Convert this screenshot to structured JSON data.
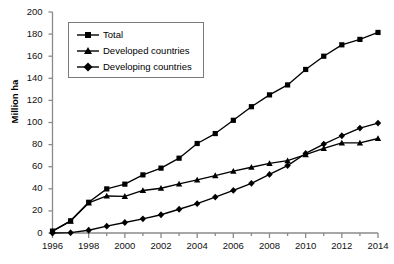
{
  "chart_data": {
    "type": "line",
    "title": "",
    "xlabel": "",
    "ylabel": "Million ha",
    "xlim": [
      1996,
      2014
    ],
    "ylim": [
      0,
      200
    ],
    "grid": false,
    "legend_position": "top-left",
    "x": [
      1996,
      1997,
      1998,
      1999,
      2000,
      2001,
      2002,
      2003,
      2004,
      2005,
      2006,
      2007,
      2008,
      2009,
      2010,
      2011,
      2012,
      2013,
      2014
    ],
    "xticks": [
      "1996",
      "1998",
      "2000",
      "2002",
      "2004",
      "2006",
      "2008",
      "2010",
      "2012",
      "2014"
    ],
    "yticks": [
      "0",
      "20",
      "40",
      "60",
      "80",
      "100",
      "120",
      "140",
      "160",
      "180",
      "200"
    ],
    "series": [
      {
        "name": "Total",
        "marker": "square",
        "values": [
          1.7,
          11.0,
          27.8,
          39.9,
          44.2,
          52.6,
          58.7,
          67.7,
          81.0,
          90.0,
          102.0,
          114.3,
          125.0,
          134.0,
          148.0,
          160.0,
          170.3,
          175.2,
          181.5
        ]
      },
      {
        "name": "Developed countries",
        "marker": "triangle",
        "values": [
          1.7,
          10.8,
          27.2,
          33.5,
          33.2,
          38.5,
          40.5,
          44.5,
          48.0,
          52.0,
          56.0,
          59.5,
          63.0,
          65.5,
          71.0,
          76.5,
          81.5,
          81.5,
          85.5
        ]
      },
      {
        "name": "Developing countries",
        "marker": "diamond",
        "values": [
          0.0,
          0.3,
          2.5,
          6.2,
          9.5,
          12.8,
          16.5,
          21.5,
          26.5,
          32.5,
          38.5,
          45.0,
          53.0,
          61.0,
          72.0,
          80.5,
          88.0,
          95.0,
          99.5
        ]
      }
    ]
  },
  "legend": {
    "items": [
      {
        "label": "Total"
      },
      {
        "label": "Developed countries"
      },
      {
        "label": "Developing countries"
      }
    ]
  },
  "axes": {
    "y_title": "Million ha"
  }
}
